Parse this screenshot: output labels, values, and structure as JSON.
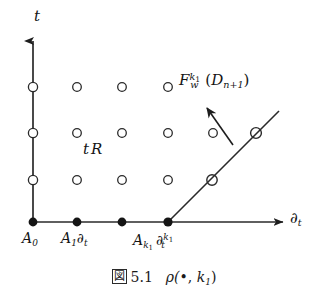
{
  "figure": {
    "caption": {
      "box_glyph": "図",
      "number": "5.1",
      "formula_prefix": "ρ(",
      "formula_bullet": "•",
      "formula_mid": ", ",
      "formula_sub": "k",
      "formula_sub2": "1",
      "formula_suffix": ")"
    },
    "axes": {
      "vertical": {
        "name": "t-axis",
        "label": "t",
        "arrow": "up-arrow-head",
        "x": 33,
        "y_top": 40,
        "y_bottom": 222
      },
      "horizontal": {
        "name": "dt-axis",
        "label_base": "∂",
        "label_sub": "t",
        "arrow": "right-arrow-head",
        "y": 222,
        "x_left": 33,
        "x_right": 285
      }
    },
    "labels": {
      "t_axis_label": "t",
      "dt_axis_base": "∂",
      "dt_axis_sub": "t",
      "region_label_1": "t",
      "region_label_2": "R",
      "a0_base": "A",
      "a0_sub": "0",
      "a1_base": "A",
      "a1_sub": "1",
      "a1_op": "∂",
      "a1_op_sub": "t",
      "ak_base": "A",
      "ak_sub": "k",
      "ak_sub2": "1",
      "ak_op": "∂",
      "ak_op_sub": "t",
      "ak_op_sup": "k",
      "ak_op_sup2": "1",
      "fw_base": "F",
      "fw_sub": "w",
      "fw_sup": "k",
      "fw_sup2": "1",
      "fw_arg_open": "(",
      "fw_arg_base": "D",
      "fw_arg_sub": "n+1",
      "fw_arg_close": ")"
    },
    "colors": {
      "ink": "#141414",
      "line": "#2a2a2a",
      "background": "#ffffff"
    },
    "geometry": {
      "filled_points": [
        {
          "name": "A_0",
          "x": 33,
          "y": 222
        },
        {
          "name": "A_1 dt",
          "x": 77,
          "y": 222
        },
        {
          "name": "mid",
          "x": 122,
          "y": 222
        },
        {
          "name": "A_k1 dt^k1",
          "x": 168,
          "y": 222
        }
      ],
      "open_circles": [
        {
          "x": 33,
          "y": 87
        },
        {
          "x": 77,
          "y": 87
        },
        {
          "x": 122,
          "y": 87
        },
        {
          "x": 168,
          "y": 87
        },
        {
          "x": 33,
          "y": 133
        },
        {
          "x": 77,
          "y": 133
        },
        {
          "x": 122,
          "y": 133
        },
        {
          "x": 168,
          "y": 133
        },
        {
          "x": 213,
          "y": 133
        },
        {
          "x": 33,
          "y": 180
        },
        {
          "x": 77,
          "y": 180
        },
        {
          "x": 122,
          "y": 180
        },
        {
          "x": 168,
          "y": 180
        }
      ],
      "circles_on_diagonal": [
        {
          "x": 212,
          "y": 180
        },
        {
          "x": 256,
          "y": 133
        }
      ],
      "diagonal_line": {
        "x1": 168,
        "y1": 222,
        "x2": 279,
        "y2": 111
      },
      "pointer_arrow": {
        "x1": 233,
        "y1": 144,
        "x2": 206,
        "y2": 106
      }
    }
  }
}
